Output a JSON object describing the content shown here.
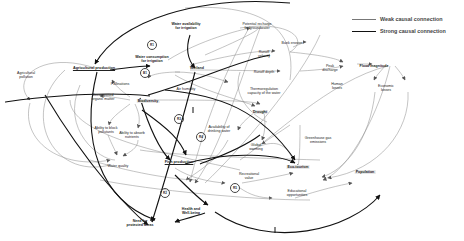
{
  "legend": {
    "weak": "Weak causal connection",
    "strong": "Strong causal connection"
  },
  "nodes": {
    "agricultural_production": "Agricultural production",
    "agricultural_pollution_1": "Agricultural",
    "agricultural_pollution_2": "pollution",
    "water_availability_1": "Water availability",
    "water_availability_2": "for irrigation",
    "water_consumption_1": "Water consumption",
    "water_consumption_2": "for irrigation",
    "potential_recharge_1": "Potential recharge",
    "potential_recharge_2": "for groundwater",
    "bank_erosion": "Bank erosion",
    "runoff_velocity_1": "Runoff",
    "runoff_velocity_2": "velocity",
    "runoff_depth": "Runoff depth",
    "peak_discharge_1": "Peak",
    "peak_discharge_2": "discharge",
    "flood_magnitude": "Flood magnitude",
    "human_losses_1": "Human",
    "human_losses_2": "losses",
    "economic_losses_1": "Economic",
    "economic_losses_2": "losses",
    "wetland": "Wetland",
    "pollinations": "Pollinations",
    "decomposed_1": "Decomposed",
    "decomposed_2": "organic matter",
    "biodiversity": "Biodiversity",
    "air_humidity": "Air humidity",
    "thermoregulation_1": "Thermoregulation",
    "thermoregulation_2": "capacity of the water",
    "drought": "Drought",
    "ability_block_1": "Ability to block",
    "ability_block_2": "pollutants",
    "ability_absorb_1": "Ability to absorb",
    "ability_absorb_2": "nutrients",
    "availability_drinking_1": "Availability of",
    "availability_drinking_2": "drinking water",
    "greenhouse_1": "Greenhouse gas",
    "greenhouse_2": "emissions",
    "global_warming_1": "Global",
    "global_warming_2": "warming",
    "water_quality": "Water quality",
    "fish_production": "Fish production",
    "ecotourism": "Eco-tourism",
    "population": "Population",
    "recreational_1": "Recreational",
    "recreational_2": "value",
    "educational_1": "Educational",
    "educational_2": "opportunities",
    "health_1": "Health and",
    "health_2": "Well-being",
    "need_protected_1": "Need for",
    "need_protected_2": "protected areas"
  },
  "loops": {
    "r1": "R1",
    "b1": "B1",
    "r3": "R3",
    "r4": "R4",
    "r2": "R2",
    "r5": "R5"
  },
  "colors": {
    "weak_line": "#777777",
    "strong_line": "#111111",
    "highlight_bg": "#e6e6e6"
  }
}
